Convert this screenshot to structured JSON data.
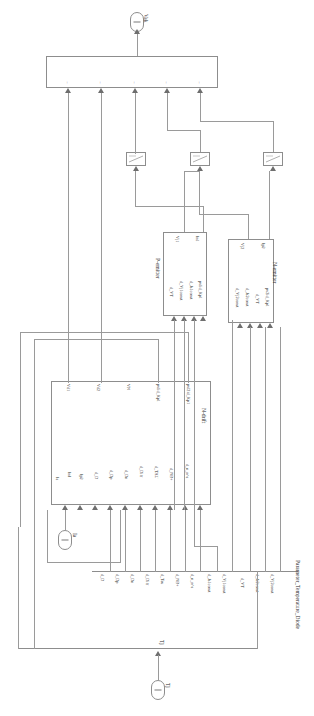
{
  "diagram": {
    "title": "Parameter_Temperature_Diode",
    "orientation": "rotated-90",
    "type": "block-diagram"
  },
  "ports": {
    "output_vak": {
      "label": "Vak",
      "number": "1"
    },
    "input_ia": {
      "label": "Ia",
      "number": "1"
    },
    "input_tj": {
      "label": "Tj",
      "number": "1"
    }
  },
  "sum_block": {
    "name": "sum",
    "signs": [
      "+",
      "+",
      "+",
      "+",
      "+"
    ]
  },
  "gain_blocks": [
    {
      "name": "gain-1"
    },
    {
      "name": "gain-2"
    },
    {
      "name": "gain-3"
    }
  ],
  "blocks": {
    "ndrift": {
      "title": "N-drift",
      "inputs": [
        "Ia",
        "InI",
        "Ip2",
        "d_D",
        "d_Dp",
        "d_Dn",
        "d_Diff",
        "d_TAU",
        "d_NB+",
        "d_n_n^a"
      ],
      "outputs": [
        "Vd1",
        "Vd2",
        "VN",
        "pvlid_Kp1",
        "pvl2id_Kp1"
      ]
    },
    "pemitter": {
      "title": "P-emitter",
      "inputs": [
        "pvlid_Kp1",
        "d_Js1const",
        "d_Vj1const",
        "d_VT"
      ],
      "outputs": [
        "In1",
        "Vj1"
      ]
    },
    "nemitter": {
      "title": "N-emitter",
      "inputs": [
        "pv2id_Kp1",
        "d_VT",
        "d_Js2const",
        "d_Vj2const"
      ],
      "outputs": [
        "Ip2",
        "Vj2"
      ]
    }
  },
  "parameter_bus": {
    "label": "Parameter_Temperature_Diode",
    "signals": [
      "d_D",
      "d_Dp",
      "d_Dn",
      "d_Diff",
      "d_Tau",
      "d_NB+",
      "d_n_n^a",
      "d_Js1const",
      "d_Vj1const",
      "d_VT",
      "d_Js2const",
      "d_Vj2const"
    ]
  },
  "tj_bus": {
    "label": "Tj"
  },
  "colors": {
    "line": "#9a9a9a",
    "block_border": "#8d8d8d",
    "text": "#2b2b2b",
    "background": "#ffffff"
  }
}
